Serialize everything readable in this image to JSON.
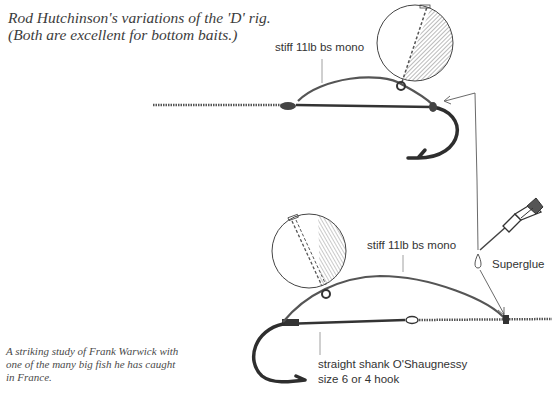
{
  "captions": {
    "top_line1": "Rod Hutchinson's variations of the 'D' rig.",
    "top_line2": "(Both are excellent for bottom baits.)",
    "bottom_line1": "A striking study of Frank Warwick with",
    "bottom_line2": "one of the many big fish he has caught",
    "bottom_line3": "in France."
  },
  "diagram": {
    "rig1": {
      "label_mono": "stiff 11lb bs mono"
    },
    "rig2": {
      "label_mono": "stiff 11lb bs mono",
      "label_glue": "Superglue",
      "label_hook_line1": "straight shank O'Shaugnessy",
      "label_hook_line2": "size 6 or 4 hook"
    },
    "colors": {
      "line": "#3a3a3a",
      "text": "#333333",
      "background": "#ffffff"
    }
  }
}
